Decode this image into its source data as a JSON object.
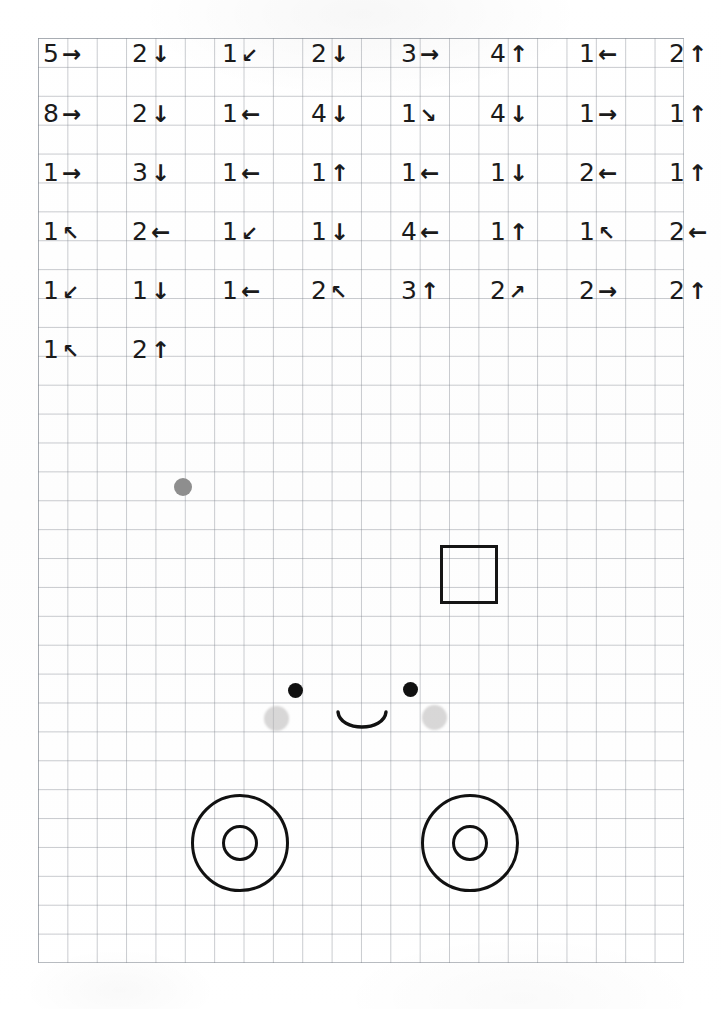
{
  "page": {
    "kind": "graph-paper-worksheet",
    "background_color": "#fefefe",
    "grid_line_color": "#7d828c",
    "ink_color": "#1b1b1b"
  },
  "instructions": {
    "description": "Handwritten-style sequence of step-count and direction pairs written across the top of the grid paper",
    "rows": [
      {
        "row": 1,
        "cells": [
          {
            "count": "5",
            "direction": "right",
            "glyph": "→"
          },
          {
            "count": "2",
            "direction": "down",
            "glyph": "↓"
          },
          {
            "count": "1",
            "direction": "down-left",
            "glyph": "↙"
          },
          {
            "count": "2",
            "direction": "down",
            "glyph": "↓"
          },
          {
            "count": "3",
            "direction": "right",
            "glyph": "→"
          },
          {
            "count": "4",
            "direction": "up",
            "glyph": "↑"
          },
          {
            "count": "1",
            "direction": "left",
            "glyph": "←"
          },
          {
            "count": "2",
            "direction": "up",
            "glyph": "↑"
          }
        ]
      },
      {
        "row": 2,
        "cells": [
          {
            "count": "8",
            "direction": "right",
            "glyph": "→"
          },
          {
            "count": "2",
            "direction": "down",
            "glyph": "↓"
          },
          {
            "count": "1",
            "direction": "left",
            "glyph": "←"
          },
          {
            "count": "4",
            "direction": "down",
            "glyph": "↓"
          },
          {
            "count": "1",
            "direction": "down-right",
            "glyph": "↘"
          },
          {
            "count": "4",
            "direction": "down",
            "glyph": "↓"
          },
          {
            "count": "1",
            "direction": "right",
            "glyph": "→"
          },
          {
            "count": "1",
            "direction": "up",
            "glyph": "↑"
          }
        ]
      },
      {
        "row": 3,
        "cells": [
          {
            "count": "1",
            "direction": "right",
            "glyph": "→"
          },
          {
            "count": "3",
            "direction": "down",
            "glyph": "↓"
          },
          {
            "count": "1",
            "direction": "left",
            "glyph": "←"
          },
          {
            "count": "1",
            "direction": "up",
            "glyph": "↑"
          },
          {
            "count": "1",
            "direction": "left",
            "glyph": "←"
          },
          {
            "count": "1",
            "direction": "down",
            "glyph": "↓"
          },
          {
            "count": "2",
            "direction": "left",
            "glyph": "←"
          },
          {
            "count": "1",
            "direction": "up",
            "glyph": "↑"
          }
        ]
      },
      {
        "row": 4,
        "cells": [
          {
            "count": "1",
            "direction": "up-left",
            "glyph": "↖"
          },
          {
            "count": "2",
            "direction": "left",
            "glyph": "←"
          },
          {
            "count": "1",
            "direction": "down-left",
            "glyph": "↙"
          },
          {
            "count": "1",
            "direction": "down",
            "glyph": "↓"
          },
          {
            "count": "4",
            "direction": "left",
            "glyph": "←"
          },
          {
            "count": "1",
            "direction": "up",
            "glyph": "↑"
          },
          {
            "count": "1",
            "direction": "up-left",
            "glyph": "↖"
          },
          {
            "count": "2",
            "direction": "left",
            "glyph": "←"
          }
        ]
      },
      {
        "row": 5,
        "cells": [
          {
            "count": "1",
            "direction": "down-left",
            "glyph": "↙"
          },
          {
            "count": "1",
            "direction": "down",
            "glyph": "↓"
          },
          {
            "count": "1",
            "direction": "left",
            "glyph": "←"
          },
          {
            "count": "2",
            "direction": "up-left",
            "glyph": "↖"
          },
          {
            "count": "3",
            "direction": "up",
            "glyph": "↑"
          },
          {
            "count": "2",
            "direction": "up-right",
            "glyph": "↗"
          },
          {
            "count": "2",
            "direction": "right",
            "glyph": "→"
          },
          {
            "count": "2",
            "direction": "up",
            "glyph": "↑"
          }
        ]
      },
      {
        "row": 6,
        "cells": [
          {
            "count": "1",
            "direction": "up-left",
            "glyph": "↖"
          },
          {
            "count": "2",
            "direction": "up",
            "glyph": "↑"
          }
        ]
      }
    ]
  },
  "drawing": {
    "description": "Hand-drawn figure on the lower portion of the grid: a smiling face with two cheeks, a small open square, a lone gray dot, and two concentric-circle wheels",
    "shapes": [
      {
        "name": "gray-dot",
        "kind": "filled-circle",
        "color": "#8e8e8e"
      },
      {
        "name": "square",
        "kind": "open-square",
        "color": "#151515"
      },
      {
        "name": "eye-left",
        "kind": "filled-circle",
        "color": "#111111"
      },
      {
        "name": "eye-right",
        "kind": "filled-circle",
        "color": "#111111"
      },
      {
        "name": "cheek-left",
        "kind": "soft-circle",
        "color": "#b4b2b2"
      },
      {
        "name": "cheek-right",
        "kind": "soft-circle",
        "color": "#b4b2b2"
      },
      {
        "name": "smile",
        "kind": "arc",
        "color": "#111111"
      },
      {
        "name": "wheel-left",
        "kind": "concentric-circles",
        "color": "#111111"
      },
      {
        "name": "wheel-right",
        "kind": "concentric-circles",
        "color": "#111111"
      }
    ]
  }
}
